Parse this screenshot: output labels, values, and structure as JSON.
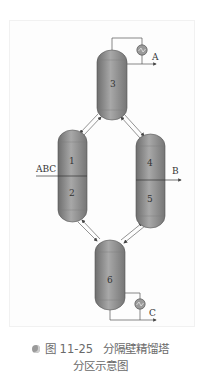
{
  "figure": {
    "columns": [
      {
        "id": "column-3",
        "label": "3"
      },
      {
        "id": "column-1-2",
        "labels": [
          "1",
          "2"
        ]
      },
      {
        "id": "column-4-5",
        "labels": [
          "4",
          "5"
        ]
      },
      {
        "id": "column-6",
        "label": "6"
      }
    ],
    "streams": {
      "feed": "ABC",
      "side": "B",
      "top": "A",
      "bottom": "C"
    },
    "colors": {
      "column_fill": "#8c8c8c",
      "line": "#555555"
    }
  },
  "caption": {
    "number": "图 11-25",
    "title": "分隔壁精馏塔",
    "line2": "分区示意图"
  }
}
